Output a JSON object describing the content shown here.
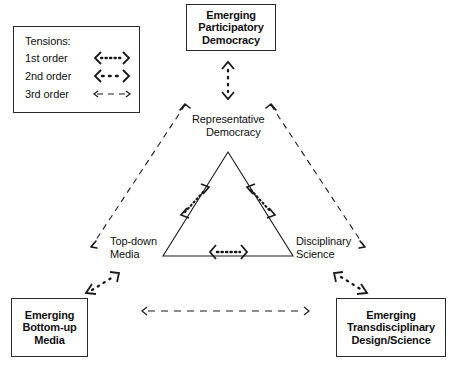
{
  "diagram": {
    "legend": {
      "name": "tensions-legend",
      "title": "Tensions:",
      "rows": [
        {
          "label": "1st order",
          "sample": "dotted-double-arrow-dense"
        },
        {
          "label": "2nd order",
          "sample": "dotted-double-arrow-sparse"
        },
        {
          "label": "3rd order",
          "sample": "dashed-double-arrow"
        }
      ]
    },
    "boxes": {
      "participatory_democracy": {
        "name": "emerging-participatory-democracy-box",
        "lines": [
          "Emerging",
          "Participatory",
          "Democracy"
        ]
      },
      "bottom_up_media": {
        "name": "emerging-bottom-up-media-box",
        "lines": [
          "Emerging",
          "Bottom-up",
          "Media"
        ]
      },
      "transdisciplinary": {
        "name": "emerging-transdisciplinary-design-science-box",
        "lines": [
          "Emerging",
          "Transdisciplinary",
          "Design/Science"
        ]
      }
    },
    "inner_nodes": {
      "representative_democracy": {
        "name": "representative-democracy-label",
        "lines": [
          "Representative",
          "Democracy"
        ]
      },
      "top_down_media": {
        "name": "top-down-media-label",
        "lines": [
          "Top-down",
          "Media"
        ]
      },
      "disciplinary_science": {
        "name": "disciplinary-science-label",
        "lines": [
          "Disciplinary",
          "Science"
        ]
      }
    },
    "connectors": [
      {
        "name": "tension-representative-topdown",
        "order": "1st order",
        "style": "dotted-double-arrow-dense"
      },
      {
        "name": "tension-representative-disciplinary",
        "order": "1st order",
        "style": "dotted-double-arrow-dense"
      },
      {
        "name": "tension-topdown-disciplinary",
        "order": "1st order",
        "style": "dotted-double-arrow-dense"
      },
      {
        "name": "tension-representative-participatory",
        "order": "2nd order",
        "style": "dotted-double-arrow-sparse"
      },
      {
        "name": "tension-topdown-bottomup",
        "order": "2nd order",
        "style": "dotted-double-arrow-sparse"
      },
      {
        "name": "tension-disciplinary-transdisciplinary",
        "order": "2nd order",
        "style": "dotted-double-arrow-sparse"
      },
      {
        "name": "tension-bottomup-transdisciplinary",
        "order": "3rd order",
        "style": "dashed-double-arrow"
      }
    ],
    "colors": {
      "stroke": "#1a1a1a",
      "text": "#111111",
      "background": "#ffffff"
    }
  }
}
